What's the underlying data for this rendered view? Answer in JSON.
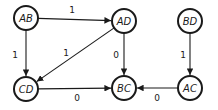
{
  "diagram": {
    "type": "directed-graph",
    "nodes": [
      {
        "id": "AB",
        "label": "AB",
        "cx": 26,
        "cy": 18
      },
      {
        "id": "AD",
        "label": "AD",
        "cx": 124,
        "cy": 21
      },
      {
        "id": "BD",
        "label": "BD",
        "cx": 190,
        "cy": 21
      },
      {
        "id": "CD",
        "label": "CD",
        "cx": 26,
        "cy": 89
      },
      {
        "id": "BC",
        "label": "BC",
        "cx": 124,
        "cy": 88
      },
      {
        "id": "AC",
        "label": "AC",
        "cx": 190,
        "cy": 88
      }
    ],
    "edges": [
      {
        "from": "AB",
        "to": "AD",
        "label": "1",
        "lx": 72,
        "ly": 10
      },
      {
        "from": "AB",
        "to": "CD",
        "label": "1",
        "lx": 15,
        "ly": 55
      },
      {
        "from": "AD",
        "to": "CD",
        "label": "1",
        "lx": 66,
        "ly": 53
      },
      {
        "from": "AD",
        "to": "BC",
        "label": "0",
        "lx": 116,
        "ly": 55
      },
      {
        "from": "BD",
        "to": "AC",
        "label": "1",
        "lx": 183,
        "ly": 55
      },
      {
        "from": "CD",
        "to": "BC",
        "label": "0",
        "lx": 77,
        "ly": 98
      },
      {
        "from": "AC",
        "to": "BC",
        "label": "0",
        "lx": 157,
        "ly": 98
      }
    ],
    "node_radius": 12
  }
}
